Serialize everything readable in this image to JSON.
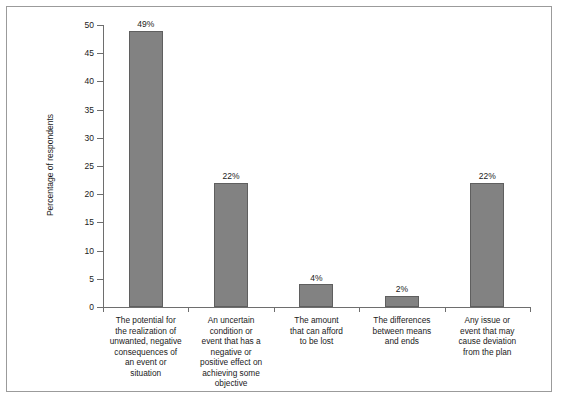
{
  "chart_data": {
    "type": "bar",
    "title": "",
    "subtitle": "",
    "xlabel": "",
    "ylabel": "Percentage of respondents",
    "ylim": [
      0,
      50
    ],
    "yticks": [
      0,
      5,
      10,
      15,
      20,
      25,
      30,
      35,
      40,
      45,
      50
    ],
    "ytick_labels": [
      "0",
      "5",
      "10",
      "15",
      "20",
      "25",
      "30",
      "35",
      "40",
      "45",
      "50"
    ],
    "grid": false,
    "legend": null,
    "bar_color": "#828282",
    "bar_edge_color": "#5f5f5f",
    "categories": [
      "The potential for the realization of unwanted, negative consequences of an event or situation",
      "An uncertain condition or event that has a negative or positive effect on achieving some objective",
      "The amount that can afford to be lost",
      "The differences between means and ends",
      "Any issue or event that may cause deviation from the plan"
    ],
    "category_lines": [
      [
        "The potential for",
        "the realization of",
        "unwanted, negative",
        "consequences of",
        "an event or",
        "situation"
      ],
      [
        "An uncertain",
        "condition or",
        "event that has a",
        "negative or",
        "positive effect on",
        "achieving some",
        "objective"
      ],
      [
        "The amount",
        "that can afford",
        "to be lost"
      ],
      [
        "The differences",
        "between means",
        "and ends"
      ],
      [
        "Any issue or",
        "event that may",
        "cause deviation",
        "from the plan"
      ]
    ],
    "values": [
      49,
      22,
      4,
      2,
      22
    ],
    "data_labels": [
      "49%",
      "22%",
      "4%",
      "2%",
      "22%"
    ]
  },
  "frame": {
    "border_color": "#9b9b9b",
    "background": "#ffffff"
  }
}
